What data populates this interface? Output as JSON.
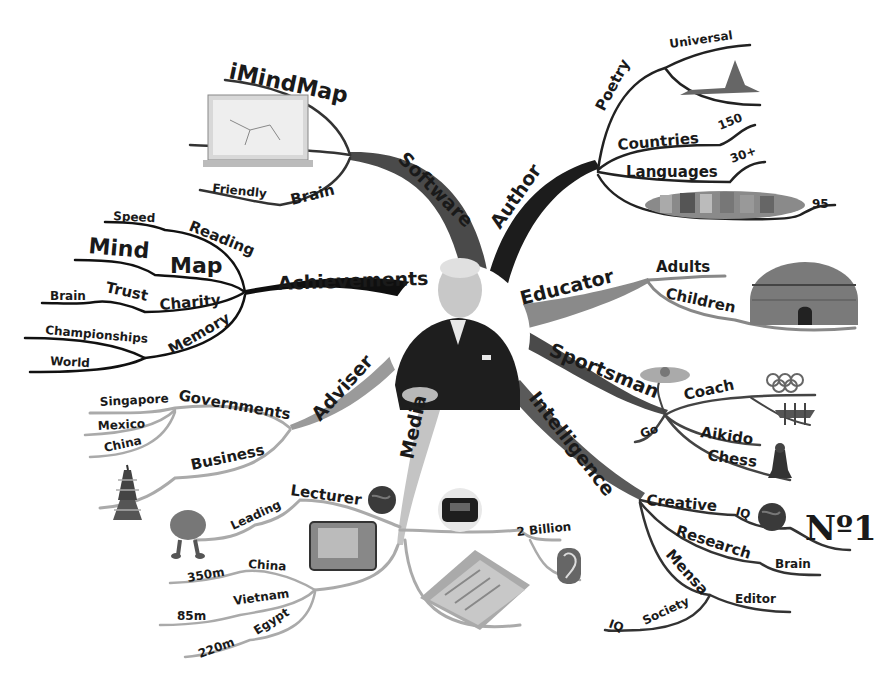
{
  "diagram": {
    "type": "mind-map",
    "central": {
      "name": "Tony Buzan portrait",
      "shape": "circle"
    },
    "colors": {
      "background": "#ffffff",
      "text": "#1a1a1a",
      "branch_black": "#111111",
      "branch_dark": "#3c3c3c",
      "branch_mid": "#6a6a6a",
      "branch_light": "#a8a8a8",
      "branch_pale": "#c9c9c9"
    },
    "branches": {
      "software": {
        "label": "Software",
        "children": {
          "imindmap": "iMindMap",
          "brain": "Brain",
          "friendly": "Friendly"
        }
      },
      "author": {
        "label": "Author",
        "children": {
          "poetry": "Poetry",
          "universal": "Universal",
          "countries": "Countries",
          "countries_value": "150",
          "languages": "Languages",
          "languages_value": "30+",
          "books_value": "95"
        }
      },
      "educator": {
        "label": "Educator",
        "children": {
          "adults": "Adults",
          "children": "Children"
        }
      },
      "sportsman": {
        "label": "Sportsman",
        "children": {
          "coach": "Coach",
          "go": "Go",
          "aikido": "Aikido",
          "chess": "Chess"
        }
      },
      "intelligence": {
        "label": "Intelligence",
        "children": {
          "creative": "Creative",
          "iq": "IQ",
          "no1": "Nº1",
          "research": "Research",
          "research_brain": "Brain",
          "mensa": "Mensa",
          "editor": "Editor",
          "society": "Society",
          "society_iq": "IQ"
        }
      },
      "media": {
        "label": "Media",
        "children": {
          "lecturer": "Lecturer",
          "leading": "Leading",
          "two_billion": "2 Billion",
          "china": "China",
          "china_value": "350m",
          "vietnam": "Vietnam",
          "vietnam_value": "85m",
          "egypt": "Egypt",
          "egypt_value": "220m"
        }
      },
      "adviser": {
        "label": "Adviser",
        "children": {
          "governments": "Governments",
          "singapore": "Singapore",
          "mexico": "Mexico",
          "china": "China",
          "business": "Business"
        }
      },
      "achievements": {
        "label": "Achievements",
        "children": {
          "reading": "Reading",
          "speed": "Speed",
          "map": "Map",
          "mind": "Mind",
          "charity": "Charity",
          "trust": "Trust",
          "brain": "Brain",
          "memory": "Memory",
          "championships": "Championships",
          "world": "World"
        }
      }
    },
    "images": [
      "laptop-image",
      "concorde-image",
      "books-image",
      "royal-albert-hall-image",
      "swimmer-image",
      "olympic-rings-image",
      "rowing-boat-image",
      "chess-piece-image",
      "globe-image",
      "tv-image",
      "radio-image",
      "ear-image",
      "newspapers-image",
      "brain-character-image",
      "pagoda-image"
    ]
  }
}
